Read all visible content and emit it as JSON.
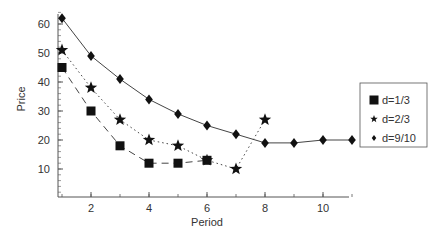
{
  "chart_data": {
    "type": "line",
    "title": "",
    "xlabel": "Period",
    "ylabel": "Price",
    "xlim": [
      0.85,
      10.9
    ],
    "ylim": [
      0,
      65
    ],
    "xticks": [
      2,
      4,
      6,
      8,
      10
    ],
    "yticks": [
      10,
      20,
      30,
      40,
      50,
      60
    ],
    "grid": false,
    "legend_position": "right",
    "series": [
      {
        "name": "d=1/3",
        "marker": "square",
        "linestyle": "dashed",
        "x": [
          1,
          2,
          3,
          4,
          5,
          6
        ],
        "values": [
          45,
          30,
          18,
          12,
          12,
          13
        ]
      },
      {
        "name": "d=2/3",
        "marker": "star",
        "linestyle": "dotted",
        "x": [
          1,
          2,
          3,
          4,
          5,
          6,
          7,
          8
        ],
        "values": [
          51,
          38,
          27,
          20,
          18,
          13,
          10,
          27
        ]
      },
      {
        "name": "d=9/10",
        "marker": "diamond",
        "linestyle": "solid",
        "x": [
          1,
          2,
          3,
          4,
          5,
          6,
          7,
          8,
          9,
          10,
          11
        ],
        "values": [
          62,
          49,
          41,
          34,
          29,
          25,
          22,
          19,
          19,
          20,
          20
        ]
      }
    ]
  }
}
